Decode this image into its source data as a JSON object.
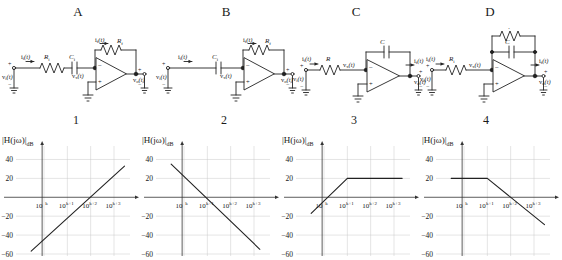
{
  "figure": {
    "title_row": [
      "A",
      "B",
      "C",
      "D"
    ],
    "number_row": [
      "1",
      "2",
      "3",
      "4"
    ],
    "axis_label_y": "|H(jω)|",
    "axis_label_y_sub": "dB",
    "axis_label_x": "ω"
  },
  "circuits": [
    {
      "letter": "A",
      "type": "op-amp-inverting",
      "input_current_label": "i",
      "input_current_sub": "i",
      "input_current_arg": "(t)",
      "input_voltage_label": "v",
      "input_voltage_sub": "i",
      "input_voltage_arg": "(t)",
      "node_voltage_label": "v",
      "node_voltage_sub": "x",
      "node_voltage_arg": "(t)",
      "output_voltage_label": "v",
      "output_voltage_sub": "o",
      "output_voltage_arg": "(t)",
      "feedback_current_label": "i",
      "feedback_current_sub": "f",
      "feedback_current_arg": "(t)",
      "input_components": [
        "R_i",
        "C_i"
      ],
      "input_component_labels": [
        {
          "sym": "R",
          "sub": "i"
        },
        {
          "sym": "C",
          "sub": "i"
        }
      ],
      "feedback_components": [
        "R_f"
      ],
      "feedback_component_labels": [
        {
          "sym": "R",
          "sub": "f"
        }
      ],
      "plus_sign": "+",
      "minus_sign": "−",
      "opamp_inv": "−",
      "opamp_noninv": "+"
    },
    {
      "letter": "B",
      "type": "op-amp-differentiator",
      "input_current_label": "i",
      "input_current_sub": "i",
      "input_current_arg": "(t)",
      "input_voltage_label": "v",
      "input_voltage_sub": "i",
      "input_voltage_arg": "(t)",
      "node_voltage_label": "v",
      "node_voltage_sub": "x",
      "node_voltage_arg": "(t)",
      "output_voltage_label": "v",
      "output_voltage_sub": "o",
      "output_voltage_arg": "(t)",
      "feedback_current_label": "i",
      "feedback_current_sub": "f",
      "feedback_current_arg": "(t)",
      "input_component_labels": [
        {
          "sym": "C",
          "sub": "i"
        }
      ],
      "feedback_component_labels": [
        {
          "sym": "R",
          "sub": "f"
        }
      ],
      "plus_sign": "+",
      "minus_sign": "−",
      "opamp_inv": "−",
      "opamp_noninv": "+"
    },
    {
      "letter": "C",
      "type": "op-amp-integrator",
      "input_current_label": "i",
      "input_current_sub": "i",
      "input_current_arg": "(t)",
      "input_voltage_label": "v",
      "input_voltage_sub": "i",
      "input_voltage_arg": "(t)",
      "node_voltage_label": "v",
      "node_voltage_sub": "x",
      "node_voltage_arg": "(t)",
      "output_voltage_label": "v",
      "output_voltage_sub": "o",
      "output_voltage_arg": "(t)",
      "feedback_current_label": "i",
      "feedback_current_sub": "f",
      "feedback_current_arg": "(t)",
      "input_component_labels": [
        {
          "sym": "R",
          "sub": ""
        }
      ],
      "feedback_component_labels": [
        {
          "sym": "C",
          "sub": ""
        }
      ],
      "plus_sign": "+",
      "minus_sign": "−",
      "opamp_inv": "−",
      "opamp_noninv": "+"
    },
    {
      "letter": "D",
      "type": "op-amp-lowpass",
      "input_current_label": "i",
      "input_current_sub": "i",
      "input_current_arg": "(t)",
      "input_voltage_label": "v",
      "input_voltage_sub": "i",
      "input_voltage_arg": "(t)",
      "node_voltage_label": "v",
      "node_voltage_sub": "x",
      "node_voltage_arg": "(t)",
      "output_voltage_label": "v",
      "output_voltage_sub": "o",
      "output_voltage_arg": "(t)",
      "feedback_current_label": "i",
      "feedback_current_sub": "f",
      "feedback_current_arg": "(t)",
      "input_component_labels": [
        {
          "sym": "R",
          "sub": "i"
        }
      ],
      "feedback_component_labels": [
        {
          "sym": "R",
          "sub": "f"
        },
        {
          "sym": "C",
          "sub": ""
        }
      ],
      "plus_sign": "+",
      "minus_sign": "−",
      "opamp_inv": "−",
      "opamp_noninv": "+"
    }
  ],
  "chart_data": [
    {
      "id": "1",
      "type": "line",
      "title": "1",
      "ylabel": "|H(jω)|dB",
      "xlabel": "ω",
      "xtick_labels": [
        "10^k",
        "10^(k+1)",
        "10^(k+2)",
        "10^(k+3)"
      ],
      "xtick_bases": [
        "10",
        "10",
        "10",
        "10"
      ],
      "xtick_exps": [
        "k",
        "k+1",
        "k+2",
        "k+3"
      ],
      "ytick_labels": [
        "40",
        "20",
        "-20",
        "-40",
        "-60"
      ],
      "ytick_values": [
        40,
        20,
        -20,
        -40,
        -60
      ],
      "ylim": [
        -60,
        50
      ],
      "xlim": [
        -0.6,
        3.6
      ],
      "grid": true,
      "slope_db_per_decade": 20,
      "points": [
        [
          -0.55,
          -57
        ],
        [
          3.45,
          33
        ]
      ],
      "description": "rising straight line, +20 dB/decade, crosses 0 dB near 10^(k+2)"
    },
    {
      "id": "2",
      "type": "line",
      "title": "2",
      "ylabel": "|H(jω)|dB",
      "xlabel": "ω",
      "xtick_labels": [
        "10^k",
        "10^(k+1)",
        "10^(k+2)",
        "10^(k+3)"
      ],
      "xtick_bases": [
        "10",
        "10",
        "10",
        "10"
      ],
      "xtick_exps": [
        "k",
        "k+1",
        "k+2",
        "k+3"
      ],
      "ytick_labels": [
        "40",
        "20",
        "-20",
        "-40",
        "-60"
      ],
      "ytick_values": [
        40,
        20,
        -20,
        -40,
        -60
      ],
      "ylim": [
        -60,
        50
      ],
      "xlim": [
        -0.6,
        3.6
      ],
      "grid": true,
      "slope_db_per_decade": -20,
      "points": [
        [
          -0.55,
          35
        ],
        [
          3.25,
          -55
        ]
      ],
      "description": "falling straight line, -20 dB/decade, crosses 0 dB near 10^(k+1.2)"
    },
    {
      "id": "3",
      "type": "line",
      "title": "3",
      "ylabel": "|H(jω)|dB",
      "xlabel": "ω",
      "xtick_labels": [
        "10^k",
        "10^(k+1)",
        "10^(k+2)",
        "10^(k+3)"
      ],
      "xtick_bases": [
        "10",
        "10",
        "10",
        "10"
      ],
      "xtick_exps": [
        "k",
        "k+1",
        "k+2",
        "k+3"
      ],
      "ytick_labels": [
        "40",
        "20",
        "-20",
        "-40",
        "-60"
      ],
      "ytick_values": [
        40,
        20,
        -20,
        -40,
        -60
      ],
      "ylim": [
        -60,
        50
      ],
      "xlim": [
        -0.6,
        3.6
      ],
      "grid": true,
      "corner_frequency": "10^(k+1)",
      "passband_gain_db": 20,
      "points": [
        [
          -0.55,
          -17
        ],
        [
          1.0,
          20
        ],
        [
          3.35,
          20
        ]
      ],
      "description": "high-pass: +20 dB/decade rise then flat at +20 dB above 10^(k+1)"
    },
    {
      "id": "4",
      "type": "line",
      "title": "4",
      "ylabel": "|H(jω)|dB",
      "xlabel": "ω",
      "xtick_labels": [
        "10^k",
        "10^(k+1)",
        "10^(k+2)",
        "10^(k+3)"
      ],
      "xtick_bases": [
        "10",
        "10",
        "10",
        "10"
      ],
      "xtick_exps": [
        "k",
        "k+1",
        "k+2",
        "k+3"
      ],
      "ytick_labels": [
        "40",
        "20",
        "-20",
        "-40",
        "-60"
      ],
      "ytick_values": [
        40,
        20,
        -20,
        -40,
        -60
      ],
      "ylim": [
        -60,
        50
      ],
      "xlim": [
        -0.6,
        3.6
      ],
      "grid": true,
      "corner_frequency": "10^(k+1)",
      "passband_gain_db": 20,
      "points": [
        [
          -0.55,
          20
        ],
        [
          1.0,
          20
        ],
        [
          3.45,
          -29
        ]
      ],
      "description": "low-pass: flat at +20 dB then -20 dB/decade roll-off above 10^(k+1)"
    }
  ]
}
